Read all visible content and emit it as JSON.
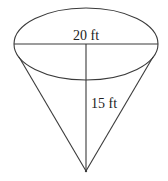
{
  "diagram": {
    "type": "cone",
    "labels": {
      "diameter": "20 ft",
      "height": "15 ft"
    },
    "geometry": {
      "ellipse": {
        "cx": 86,
        "cy": 44,
        "rx": 72,
        "ry": 36
      },
      "apex": {
        "x": 86,
        "y": 171
      },
      "left_tangent": {
        "x": 19,
        "y": 57
      },
      "right_tangent": {
        "x": 153,
        "y": 57
      }
    },
    "colors": {
      "line": "#3a3a3a",
      "text": "#222222",
      "background": "#ffffff"
    }
  }
}
